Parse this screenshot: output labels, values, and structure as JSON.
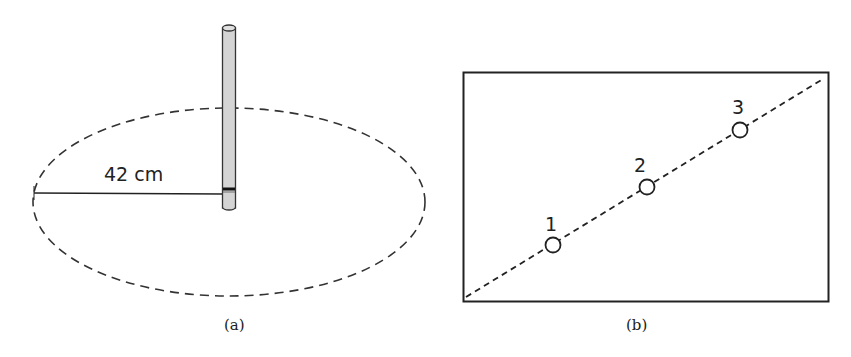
{
  "panels": [
    {
      "id": "a",
      "caption": "(a)",
      "measurement_label": "42 cm",
      "elements": {
        "pole": "vertical cylinder rod",
        "boundary": "dashed ellipse",
        "radius_line": "solid line from ellipse edge to pole"
      }
    },
    {
      "id": "b",
      "caption": "(b)",
      "elements": {
        "frame": "rectangle",
        "diagonal": "dashed line from bottom-left to top-right"
      },
      "points": [
        {
          "label": "1"
        },
        {
          "label": "2"
        },
        {
          "label": "3"
        }
      ]
    }
  ],
  "colors": {
    "stroke": "#2a2a2a",
    "pole_fill": "#d4d4d4",
    "band": "#111111"
  }
}
